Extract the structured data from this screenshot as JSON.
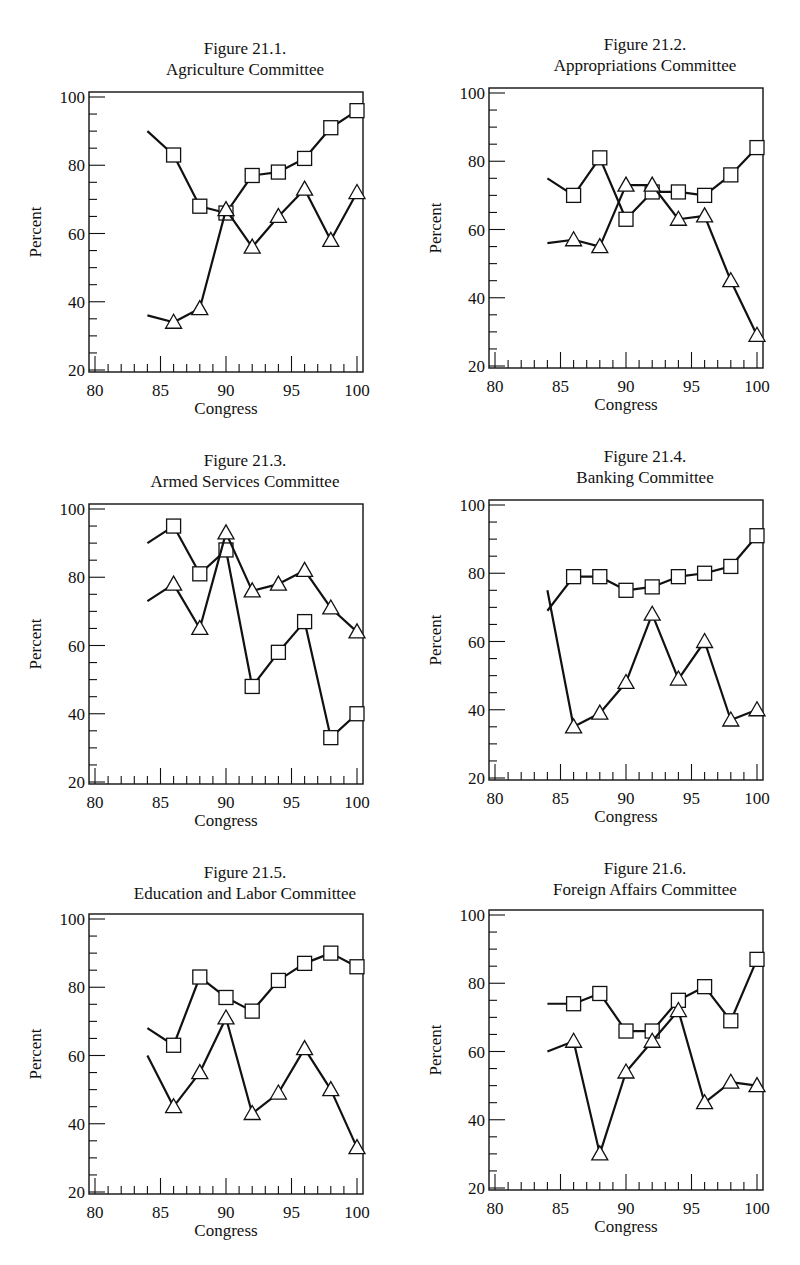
{
  "chart_data": [
    {
      "type": "line",
      "figure": "Figure 21.1.",
      "title": "Agriculture Committee",
      "xlabel": "Congress",
      "ylabel": "Percent",
      "xlim": [
        80,
        100
      ],
      "ylim": [
        20,
        100
      ],
      "xticks": [
        80,
        85,
        90,
        95,
        100
      ],
      "yticks": [
        20,
        40,
        60,
        80,
        100
      ],
      "x": [
        84,
        86,
        88,
        90,
        92,
        94,
        96,
        98,
        100
      ],
      "series": [
        {
          "name": "square",
          "marker": "square",
          "values": [
            90,
            83,
            68,
            66,
            77,
            78,
            82,
            91,
            96
          ]
        },
        {
          "name": "triangle",
          "marker": "triangle",
          "values": [
            36,
            34,
            38,
            67,
            56,
            65,
            73,
            58,
            72
          ]
        }
      ]
    },
    {
      "type": "line",
      "figure": "Figure 21.2.",
      "title": "Appropriations Committee",
      "xlabel": "Congress",
      "ylabel": "Percent",
      "xlim": [
        80,
        100
      ],
      "ylim": [
        20,
        100
      ],
      "xticks": [
        80,
        85,
        90,
        95,
        100
      ],
      "yticks": [
        20,
        40,
        60,
        80,
        100
      ],
      "x": [
        84,
        86,
        88,
        90,
        92,
        94,
        96,
        98,
        100
      ],
      "series": [
        {
          "name": "square",
          "marker": "square",
          "values": [
            75,
            70,
            81,
            63,
            71,
            71,
            70,
            76,
            84
          ]
        },
        {
          "name": "triangle",
          "marker": "triangle",
          "values": [
            56,
            57,
            55,
            73,
            73,
            63,
            64,
            45,
            29
          ]
        }
      ]
    },
    {
      "type": "line",
      "figure": "Figure 21.3.",
      "title": "Armed Services Committee",
      "xlabel": "Congress",
      "ylabel": "Percent",
      "xlim": [
        80,
        100
      ],
      "ylim": [
        20,
        100
      ],
      "xticks": [
        80,
        85,
        90,
        95,
        100
      ],
      "yticks": [
        20,
        40,
        60,
        80,
        100
      ],
      "x": [
        84,
        86,
        88,
        90,
        92,
        94,
        96,
        98,
        100
      ],
      "series": [
        {
          "name": "square",
          "marker": "square",
          "values": [
            90,
            95,
            81,
            88,
            48,
            58,
            67,
            33,
            40
          ]
        },
        {
          "name": "triangle",
          "marker": "triangle",
          "values": [
            73,
            78,
            65,
            93,
            76,
            78,
            82,
            71,
            64
          ]
        }
      ]
    },
    {
      "type": "line",
      "figure": "Figure 21.4.",
      "title": "Banking Committee",
      "xlabel": "Congress",
      "ylabel": "Percent",
      "xlim": [
        80,
        100
      ],
      "ylim": [
        20,
        100
      ],
      "xticks": [
        80,
        85,
        90,
        95,
        100
      ],
      "yticks": [
        20,
        40,
        60,
        80,
        100
      ],
      "x": [
        84,
        86,
        88,
        90,
        92,
        94,
        96,
        98,
        100
      ],
      "series": [
        {
          "name": "square",
          "marker": "square",
          "values": [
            69,
            79,
            79,
            75,
            76,
            79,
            80,
            82,
            91
          ]
        },
        {
          "name": "triangle",
          "marker": "triangle",
          "values": [
            75,
            35,
            39,
            48,
            68,
            49,
            60,
            37,
            40
          ]
        }
      ]
    },
    {
      "type": "line",
      "figure": "Figure 21.5.",
      "title": "Education and Labor Committee",
      "xlabel": "Congress",
      "ylabel": "Percent",
      "xlim": [
        80,
        100
      ],
      "ylim": [
        20,
        100
      ],
      "xticks": [
        80,
        85,
        90,
        95,
        100
      ],
      "yticks": [
        20,
        40,
        60,
        80,
        100
      ],
      "x": [
        84,
        86,
        88,
        90,
        92,
        94,
        96,
        98,
        100
      ],
      "series": [
        {
          "name": "square",
          "marker": "square",
          "values": [
            68,
            63,
            83,
            77,
            73,
            82,
            87,
            90,
            86
          ]
        },
        {
          "name": "triangle",
          "marker": "triangle",
          "values": [
            60,
            45,
            55,
            71,
            43,
            49,
            62,
            50,
            33
          ]
        }
      ]
    },
    {
      "type": "line",
      "figure": "Figure 21.6.",
      "title": "Foreign Affairs Committee",
      "xlabel": "Congress",
      "ylabel": "Percent",
      "xlim": [
        80,
        100
      ],
      "ylim": [
        20,
        100
      ],
      "xticks": [
        80,
        85,
        90,
        95,
        100
      ],
      "yticks": [
        20,
        40,
        60,
        80,
        100
      ],
      "x": [
        84,
        86,
        88,
        90,
        92,
        94,
        96,
        98,
        100
      ],
      "series": [
        {
          "name": "square",
          "marker": "square",
          "values": [
            74,
            74,
            77,
            66,
            66,
            75,
            79,
            69,
            87
          ]
        },
        {
          "name": "triangle",
          "marker": "triangle",
          "values": [
            60,
            63,
            30,
            54,
            63,
            72,
            45,
            51,
            50
          ]
        }
      ]
    }
  ]
}
